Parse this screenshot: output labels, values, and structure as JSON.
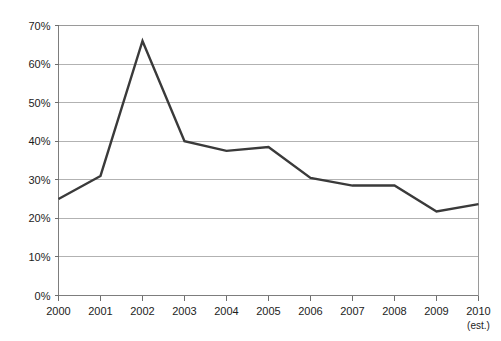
{
  "chart_data": {
    "type": "line",
    "title": "",
    "subtitle": "",
    "xlabel": "",
    "ylabel": "",
    "categories": [
      "2000",
      "2001",
      "2002",
      "2003",
      "2004",
      "2005",
      "2006",
      "2007",
      "2008",
      "2009",
      "2010"
    ],
    "category_sublabels": [
      "",
      "",
      "",
      "",
      "",
      "",
      "",
      "",
      "",
      "",
      "(est.)"
    ],
    "values": [
      25,
      31,
      66,
      40,
      37.5,
      38.5,
      30.5,
      28.5,
      28.5,
      21.8,
      23.7
    ],
    "series": [
      {
        "name": "",
        "values": [
          25,
          31,
          66,
          40,
          37.5,
          38.5,
          30.5,
          28.5,
          28.5,
          21.8,
          23.7
        ]
      }
    ],
    "ylim": [
      0,
      70
    ],
    "ytick_values": [
      0,
      10,
      20,
      30,
      40,
      50,
      60,
      70
    ],
    "ytick_labels": [
      "0%",
      "10%",
      "20%",
      "30%",
      "40%",
      "50%",
      "60%",
      "70%"
    ],
    "grid": true,
    "grid_axis": "y",
    "legend": false,
    "legend_position": "none",
    "line_color": "#3a3a3a",
    "grid_color": "#b2b2b2",
    "axis_color": "#7d7d7d",
    "background_color": "#ffffff",
    "annotations": []
  }
}
